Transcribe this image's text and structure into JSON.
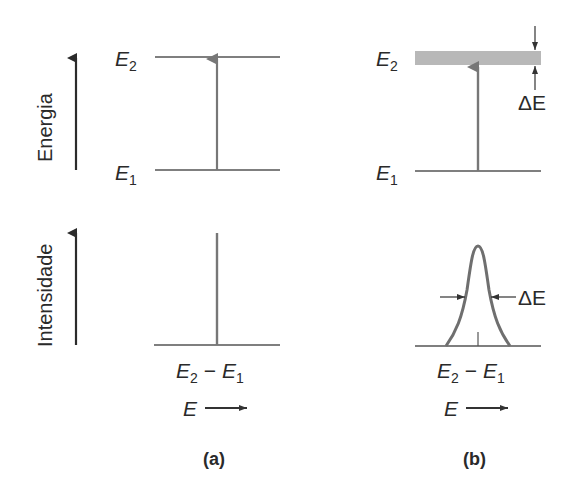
{
  "axes": {
    "energy_label": "Energia",
    "intensity_label": "Intensidade"
  },
  "panel_a": {
    "caption": "(a)",
    "upper_level": {
      "symbol": "E",
      "subscript": "2"
    },
    "lower_level": {
      "symbol": "E",
      "subscript": "1"
    },
    "spectrum_label": {
      "e2": "E",
      "e2_sub": "2",
      "minus": "−",
      "e1": "E",
      "e1_sub": "1"
    },
    "energy_axis": "E"
  },
  "panel_b": {
    "caption": "(b)",
    "upper_level": {
      "symbol": "E",
      "subscript": "2"
    },
    "lower_level": {
      "symbol": "E",
      "subscript": "1"
    },
    "band_width_label": "ΔE",
    "linewidth_label": "ΔE",
    "spectrum_label": {
      "e2": "E",
      "e2_sub": "2",
      "minus": "−",
      "e1": "E",
      "e1_sub": "1"
    },
    "energy_axis": "E"
  },
  "colors": {
    "axis_arrow": "#2b2b2b",
    "level_line": "#555555",
    "transition_arrow": "#777777",
    "band_fill": "#b8b8b8",
    "curve": "#6f6f6f",
    "text": "#2a2a2a"
  }
}
